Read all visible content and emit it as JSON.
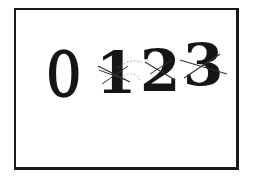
{
  "figure": {
    "digits": [
      {
        "char": "0",
        "crossed_out": false
      },
      {
        "char": "1",
        "crossed_out": true
      },
      {
        "char": "2",
        "crossed_out": true
      },
      {
        "char": "3",
        "crossed_out": true
      }
    ],
    "colors": {
      "ink": "#151515",
      "background": "#ffffff",
      "strike": "#333333"
    }
  }
}
